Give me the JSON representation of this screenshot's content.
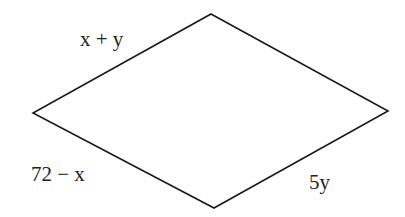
{
  "figure": {
    "type": "quadrilateral",
    "shape": "rhombus",
    "stroke_color": "#1a1a1a",
    "background": "#ffffff",
    "vertices": {
      "top": [
        211,
        14
      ],
      "right": [
        388,
        111
      ],
      "bottom": [
        214,
        208
      ],
      "left": [
        33,
        113
      ]
    },
    "sides": [
      {
        "id": "top-left",
        "label": "x + y",
        "label_pos": [
          80,
          46
        ]
      },
      {
        "id": "bottom-left",
        "label": "72 − x",
        "label_pos": [
          31,
          181
        ]
      },
      {
        "id": "bottom-right",
        "label": "5y",
        "label_pos": [
          309,
          189
        ]
      }
    ]
  }
}
